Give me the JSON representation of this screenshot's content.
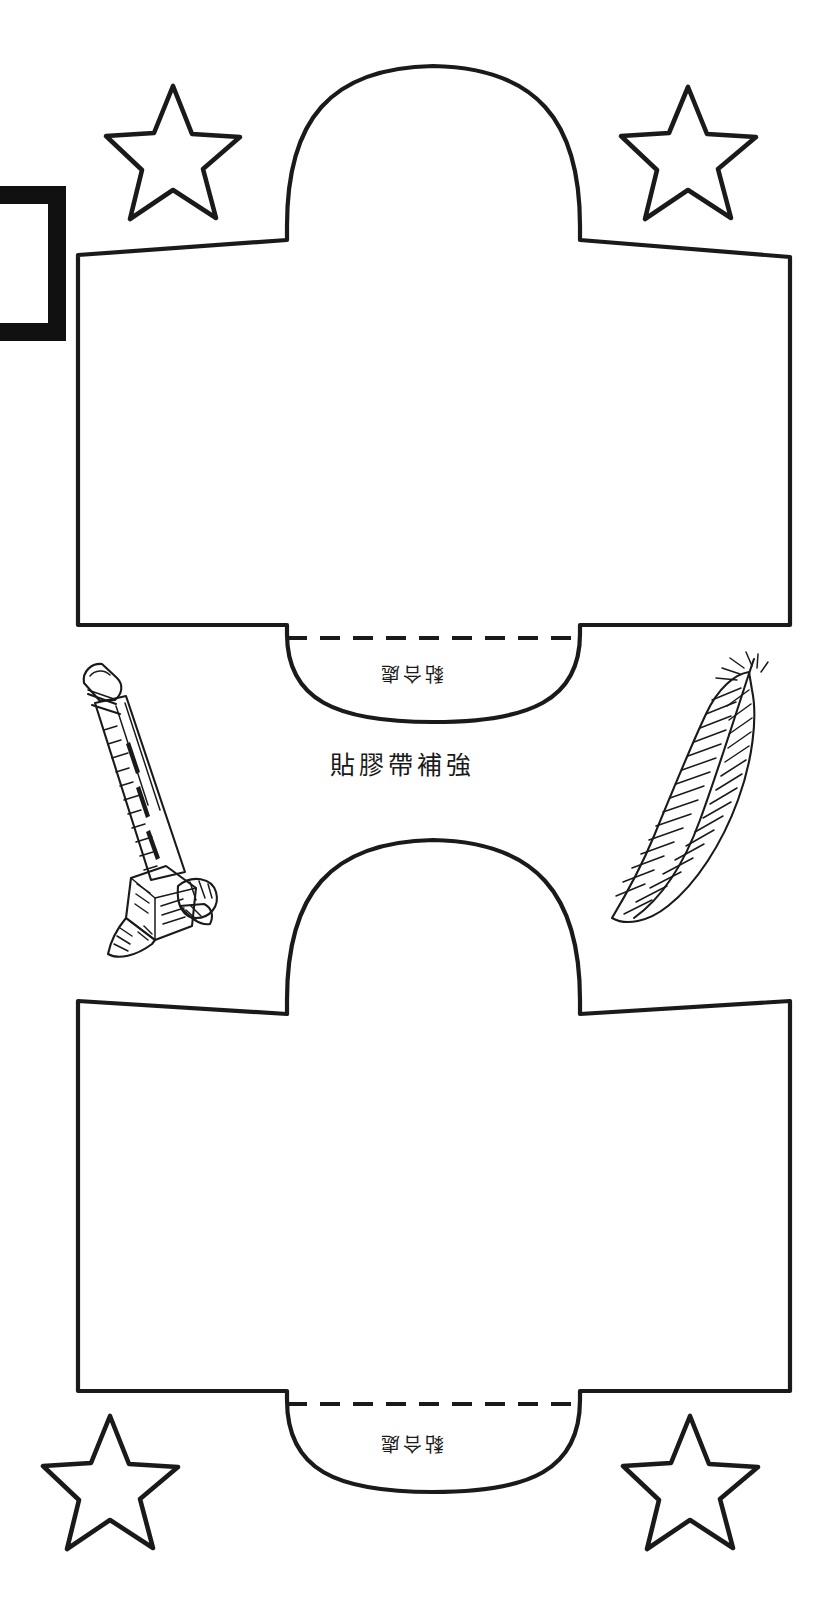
{
  "page": {
    "background_color": "#ffffff",
    "ink_color": "#1a1a1a",
    "width": 835,
    "height": 1597
  },
  "templates": [
    {
      "id": "top-template",
      "name": "上方紙型",
      "glue_label": "黏合處",
      "tape_label": "貼膠帶補強"
    },
    {
      "id": "bottom-template",
      "name": "下方紙型",
      "glue_label": "黏合處",
      "tape_label": ""
    }
  ],
  "decorations": {
    "stars": [
      {
        "name": "star-top-left"
      },
      {
        "name": "star-top-right"
      },
      {
        "name": "star-bottom-left"
      },
      {
        "name": "star-bottom-right"
      }
    ],
    "pencil_sharpener": {
      "name": "pencil-sharpener-illustration"
    },
    "feather": {
      "name": "feather-illustration"
    },
    "black_frame": {
      "name": "black-frame-fragment"
    }
  },
  "annotations": {
    "fold_line": "虛線為摺線",
    "glue_area": "黏合處",
    "tape_reinforce": "貼膠帶補強"
  }
}
